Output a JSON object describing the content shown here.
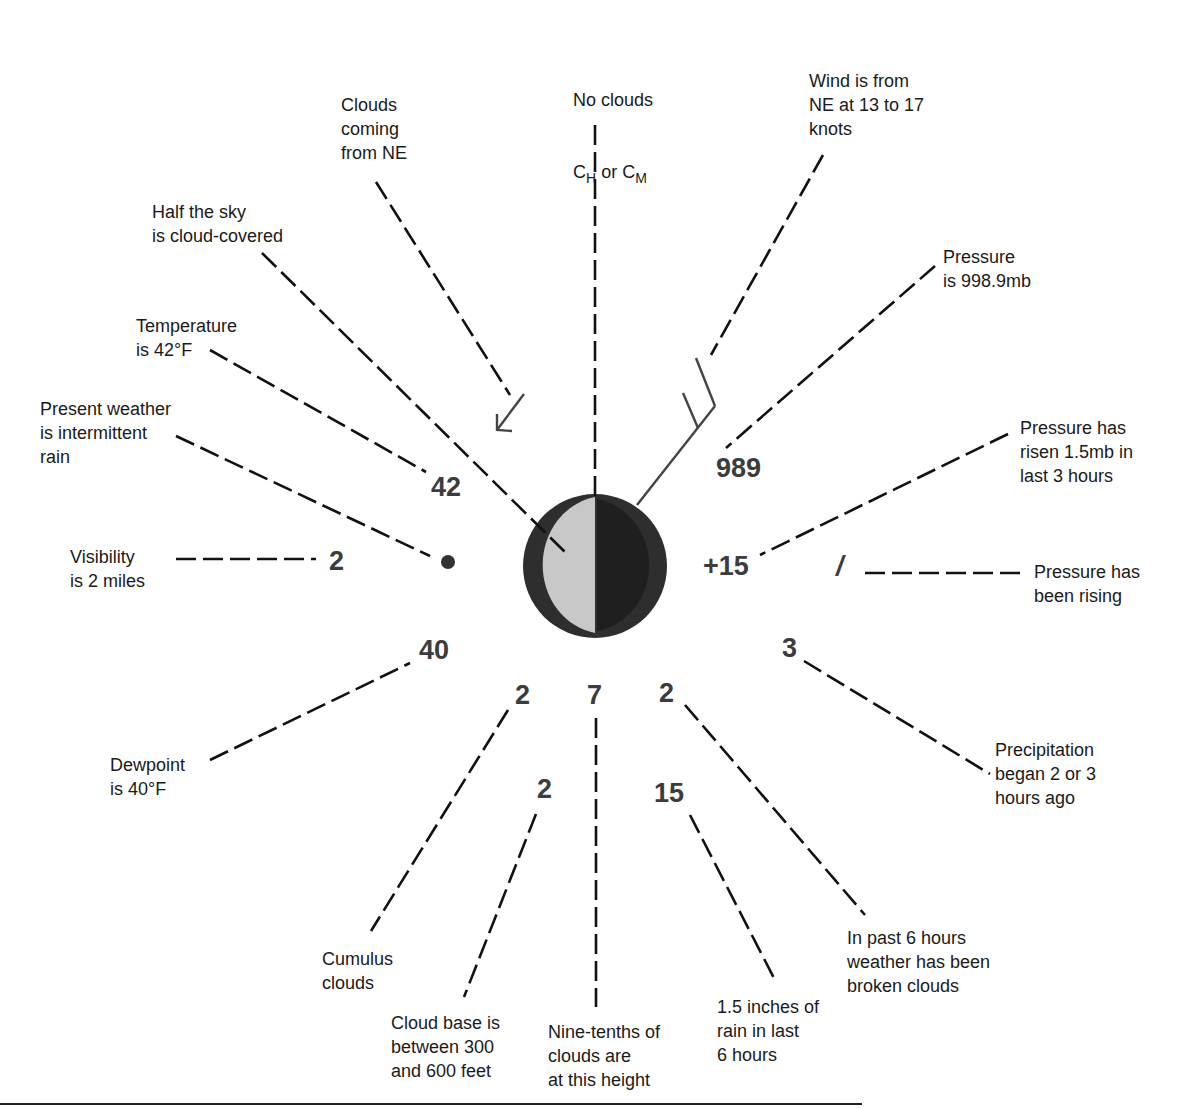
{
  "diagram": {
    "station_circle": {
      "cloud_cover": "half",
      "left_fill": "#c8c8c8",
      "right_fill": "#1f1f1f",
      "ring": "#2e2e2e"
    },
    "values": {
      "temperature": "42",
      "dewpoint": "40",
      "visibility": "2",
      "pressure": "989",
      "pressure_change": "+15",
      "pressure_tendency": "/",
      "precip_began": "3",
      "low_cloud_type": "2",
      "cloud_amount": "7",
      "past_weather": "2",
      "cloud_base": "2",
      "precip_amount": "15",
      "present_weather_symbol": "●"
    },
    "labels": {
      "no_clouds_line1": "No clouds",
      "no_clouds_c1": "C",
      "no_clouds_sub1": "H",
      "no_clouds_or": " or ",
      "no_clouds_c2": "C",
      "no_clouds_sub2": "M",
      "clouds_from": "Clouds\ncoming\nfrom NE",
      "wind": "Wind is from\nNE at 13 to 17\nknots",
      "half_sky": "Half the sky\nis cloud-covered",
      "pressure": "Pressure\nis 998.9mb",
      "temperature": "Temperature\nis 42°F",
      "present_weather": "Present weather\nis intermittent\nrain",
      "pressure_risen": "Pressure has\nrisen 1.5mb in\nlast 3 hours",
      "visibility": "Visibility\nis 2 miles",
      "pressure_rising": "Pressure has\nbeen rising",
      "precip_began": "Precipitation\nbegan 2 or 3\nhours ago",
      "dewpoint": "Dewpoint\nis 40°F",
      "cumulus": "Cumulus\nclouds",
      "cloud_base": "Cloud base is\nbetween 300\nand 600 feet",
      "nine_tenths": "Nine-tenths of\nclouds are\nat this height",
      "rain_amount": "1.5 inches of\nrain in last\n6 hours",
      "past_weather": "In past 6 hours\nweather has been\nbroken clouds"
    }
  }
}
